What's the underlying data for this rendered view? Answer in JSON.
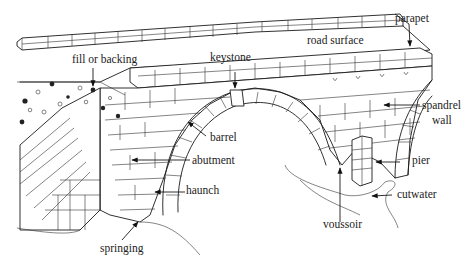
{
  "labels": {
    "parapet": "parapet",
    "road_surface": "road surface",
    "keystone": "keystone",
    "fill_or_backing": "fill or backing",
    "spandrel_wall_line1": "spandrel",
    "spandrel_wall_line2": "wall",
    "barrel": "barrel",
    "abutment": "abutment",
    "haunch": "haunch",
    "pier": "pier",
    "cutwater": "cutwater",
    "voussoir": "voussoir",
    "springing": "springing"
  },
  "colors": {
    "ink": "#1a1a1a",
    "background": "#ffffff"
  }
}
